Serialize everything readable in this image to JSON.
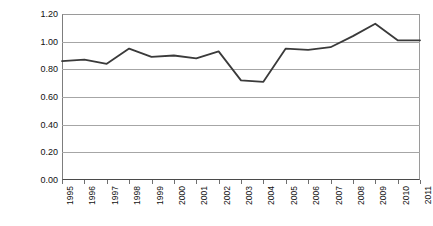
{
  "chart_data": {
    "type": "line",
    "title": "",
    "subtitle": "",
    "xlabel": "",
    "ylabel": "Resource cost in sales",
    "categories": [
      "1995",
      "1996",
      "1997",
      "1998",
      "1999",
      "2000",
      "2001",
      "2002",
      "2003",
      "2004",
      "2005",
      "2006",
      "2007",
      "2008",
      "2009",
      "2010",
      "2011"
    ],
    "x": [
      1995,
      1996,
      1997,
      1998,
      1999,
      2000,
      2001,
      2002,
      2003,
      2004,
      2005,
      2006,
      2007,
      2008,
      2009,
      2010,
      2011
    ],
    "values": [
      0.86,
      0.87,
      0.84,
      0.95,
      0.89,
      0.9,
      0.88,
      0.93,
      0.72,
      0.71,
      0.95,
      0.94,
      0.96,
      1.04,
      1.13,
      1.01,
      1.01
    ],
    "series": [
      {
        "name": "Resource cost in sales",
        "values": [
          0.86,
          0.87,
          0.84,
          0.95,
          0.89,
          0.9,
          0.88,
          0.93,
          0.72,
          0.71,
          0.95,
          0.94,
          0.96,
          1.04,
          1.13,
          1.01,
          1.01
        ],
        "color": "#3a3a3a"
      }
    ],
    "ylim": [
      0.0,
      1.2
    ],
    "ytick_values": [
      0.0,
      0.2,
      0.4,
      0.6,
      0.8,
      1.0,
      1.2
    ],
    "ytick_labels": [
      "0.00",
      "0.20",
      "0.40",
      "0.60",
      "0.80",
      "1.00",
      "1.20"
    ],
    "grid": true,
    "grid_axis": "y",
    "legend": false,
    "legend_position": "none",
    "annotations": [],
    "line_color": "#3a3a3a",
    "grid_color": "#a6a6a6",
    "axis_color": "#4a4a4a",
    "background_color": "#ffffff",
    "markers": false,
    "xtick_label_rotation": -90
  }
}
